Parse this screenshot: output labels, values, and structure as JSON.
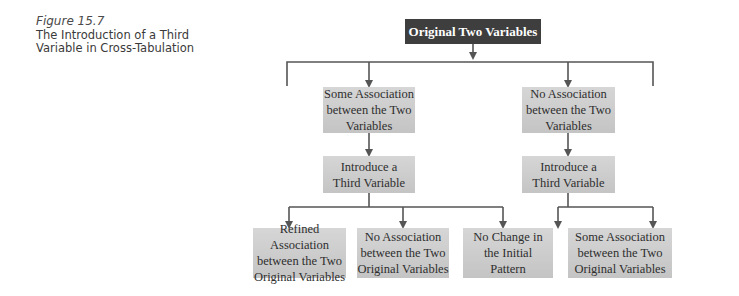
{
  "caption": {
    "figure_label": "Figure 15.7",
    "title_line1": "The Introduction of a Third",
    "title_line2": "Variable in Cross-Tabulation"
  },
  "diagram": {
    "root": "Original Two Variables",
    "level1": {
      "left": [
        "Some Association",
        "between the Two",
        "Variables"
      ],
      "right": [
        "No Association",
        "between the Two",
        "Variables"
      ]
    },
    "level2": {
      "left": [
        "Introduce a",
        "Third Variable"
      ],
      "right": [
        "Introduce a",
        "Third Variable"
      ]
    },
    "level3": [
      [
        "Refined Association",
        "between the Two",
        "Original Variables"
      ],
      [
        "No Association",
        "between the Two",
        "Original Variables"
      ],
      [
        "No Change in",
        "the Initial",
        "Pattern"
      ],
      [
        "Some Association",
        "between the Two",
        "Original Variables"
      ]
    ],
    "colors": {
      "root_fill": "#3e3e3e",
      "box_fill": "#cfcfcf",
      "line": "#555555"
    }
  }
}
